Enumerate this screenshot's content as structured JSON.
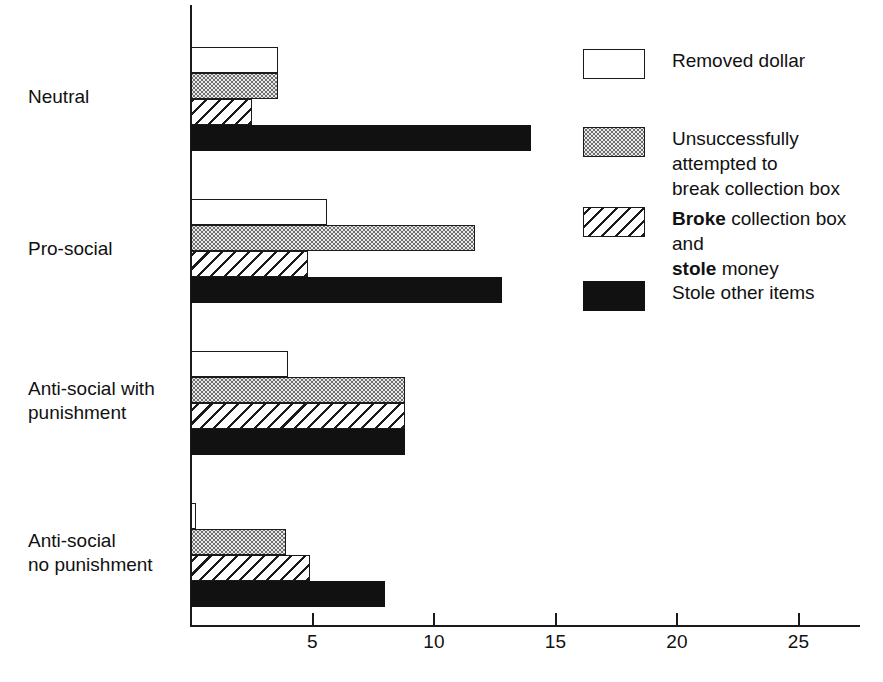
{
  "chart_data": {
    "type": "bar",
    "orientation": "horizontal",
    "title": "",
    "xlabel": "",
    "ylabel": "",
    "xlim": [
      0,
      27.5
    ],
    "grid": false,
    "legend_position": "right",
    "xticks": [
      5,
      10,
      15,
      20,
      25
    ],
    "xtick_labels": [
      "5",
      "10",
      "15",
      "20",
      "25"
    ],
    "categories": [
      "Neutral",
      "Pro-social",
      "Anti-social with\npunishment",
      "Anti-social\nno punishment"
    ],
    "series": [
      {
        "name": "Removed dollar",
        "pattern": "white",
        "values": [
          3.6,
          5.6,
          4.0,
          0.2
        ]
      },
      {
        "name": "Unsuccessfully attempted to break collection box",
        "pattern": "dotted",
        "values": [
          3.6,
          11.7,
          8.8,
          3.9
        ]
      },
      {
        "name": "Broke collection box and stole money",
        "pattern": "hatched",
        "values": [
          2.5,
          4.8,
          8.8,
          4.9
        ]
      },
      {
        "name": "Stole other items",
        "pattern": "black",
        "values": [
          14.0,
          12.8,
          8.8,
          8.0
        ]
      }
    ]
  },
  "axis": {
    "ticks": [
      {
        "value": 5,
        "label": "5"
      },
      {
        "value": 10,
        "label": "10"
      },
      {
        "value": 15,
        "label": "15"
      },
      {
        "value": 20,
        "label": "20"
      },
      {
        "value": 25,
        "label": "25"
      }
    ]
  },
  "categories": [
    {
      "id": "neutral",
      "label": "Neutral"
    },
    {
      "id": "pro-social",
      "label": "Pro-social"
    },
    {
      "id": "anti-social-with-punishment",
      "label": "Anti-social with\npunishment"
    },
    {
      "id": "anti-social-no-punishment",
      "label": "Anti-social\nno punishment"
    }
  ],
  "legend": {
    "items": [
      {
        "id": "removed-dollar",
        "pattern": "white",
        "label": "Removed dollar",
        "label_plain": "Removed dollar"
      },
      {
        "id": "unsuccessful-break",
        "pattern": "dotted",
        "label": "Unsuccessfully attempted to\nbreak collection box",
        "label_plain": "Unsuccessfully attempted to break collection box"
      },
      {
        "id": "broke-and-stole",
        "pattern": "hatched",
        "label": "Broke collection box and\nstole money",
        "label_plain": "Broke collection box and stole money",
        "bold_words": [
          "Broke",
          "stole"
        ]
      },
      {
        "id": "stole-other-items",
        "pattern": "black",
        "label": "Stole other items",
        "label_plain": "Stole other items"
      }
    ]
  },
  "colors": {
    "ink": "#111111",
    "axis": "#1a1a1a",
    "fill_white": "#ffffff",
    "fill_dotted": "#e9e9e9",
    "fill_black": "#111111",
    "background": "#ffffff"
  }
}
